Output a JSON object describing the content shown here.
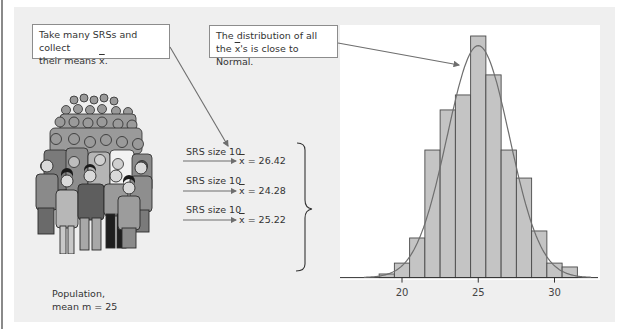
{
  "callouts": {
    "take_samples": {
      "line1": "Take many SRSs and collect",
      "line2_prefix": "their means ",
      "line2_symbol": "x",
      "line2_suffix": "."
    },
    "distribution": {
      "line1": "The distribution of all",
      "line2_prefix": "the ",
      "line2_symbol": "x",
      "line2_suffix": "'s is close to Normal."
    }
  },
  "population": {
    "label_line1": "Population,",
    "label_line2": "mean m = 25",
    "icon": "crowd-of-people-illustration"
  },
  "samples": [
    {
      "label": "SRS size 10",
      "symbol": "x",
      "result": " = 26.42"
    },
    {
      "label": "SRS size 10",
      "symbol": "x",
      "result": " = 24.28"
    },
    {
      "label": "SRS size 10",
      "symbol": "x",
      "result": " = 25.22"
    }
  ],
  "colors": {
    "panel_bg": "#efefef",
    "plot_bg": "#ffffff",
    "bar_fill": "#c4c4c4",
    "bar_stroke": "#4a4a4a",
    "curve": "#6e6e6e",
    "arrow": "#6e6e6e"
  },
  "chart_data": {
    "type": "bar",
    "title": "",
    "xlabel": "",
    "ylabel": "",
    "x_ticks": [
      20,
      25,
      30
    ],
    "bin_edges": [
      18.5,
      19.5,
      20.5,
      21.5,
      22.5,
      23.5,
      24.5,
      25.5,
      26.5,
      27.5,
      28.5,
      29.5,
      30.5,
      31.5
    ],
    "bin_centers": [
      19,
      20,
      21,
      22,
      23,
      24,
      25,
      26,
      27,
      28,
      29,
      30,
      31
    ],
    "values_relative": [
      1.5,
      6,
      16.4,
      52.8,
      69.4,
      75.6,
      100,
      83.9,
      52.8,
      41.2,
      19.3,
      6,
      4.4
    ],
    "overlay": {
      "type": "normal_curve",
      "mean": 25,
      "peak_relative": 96
    },
    "xlim": [
      17,
      33
    ],
    "grid": false,
    "legend": "none"
  }
}
